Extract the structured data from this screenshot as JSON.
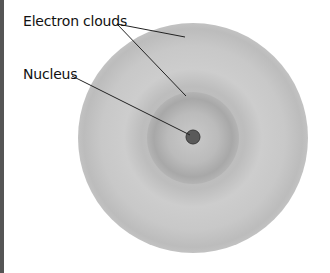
{
  "diagram": {
    "type": "atom-model",
    "labels": {
      "electron_clouds": "Electron clouds",
      "nucleus": "Nucleus"
    },
    "colors": {
      "outer_cloud": "#c4c4c4",
      "inner_cloud_ring": "#a9a9a9",
      "nucleus": "#5a5a5a",
      "leader_lines": "#222222"
    }
  }
}
